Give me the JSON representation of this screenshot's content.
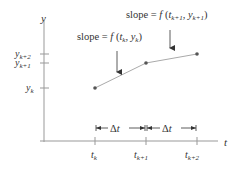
{
  "diagram": {
    "axes": {
      "y_label": "y",
      "t_label": "t"
    },
    "y_ticks": [
      {
        "base": "y",
        "sub": "k+2"
      },
      {
        "base": "y",
        "sub": "k+1"
      },
      {
        "base": "y",
        "sub": "k"
      }
    ],
    "t_ticks": [
      {
        "base": "t",
        "sub": "k"
      },
      {
        "base": "t",
        "sub": "k+1"
      },
      {
        "base": "t",
        "sub": "k+2"
      }
    ],
    "annotations": [
      {
        "prefix": "slope = ",
        "func": "f",
        "open": " (",
        "t": "t",
        "t_sub": "k",
        "sep": ", ",
        "y": "y",
        "y_sub": "k",
        "close": ")"
      },
      {
        "prefix": "slope = ",
        "func": "f",
        "open": " (",
        "t": "t",
        "t_sub": "k+1",
        "sep": ", ",
        "y": "y",
        "y_sub": "k+1",
        "close": ")"
      }
    ],
    "intervals": [
      {
        "label_delta": "Δ",
        "label_var": "t"
      },
      {
        "label_delta": "Δ",
        "label_var": "t"
      }
    ],
    "colors": {
      "axis": "#999999",
      "line": "#aaaaaa",
      "point": "#555555",
      "text": "#333333"
    }
  }
}
